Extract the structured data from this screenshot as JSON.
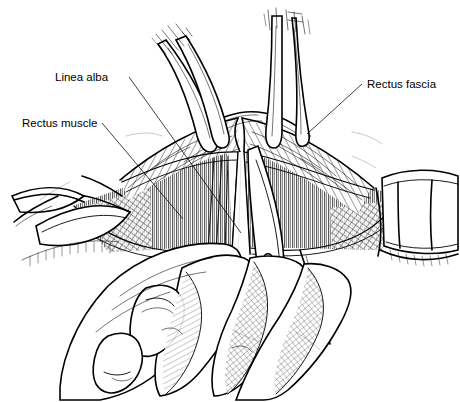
{
  "figure": {
    "kind": "surgical-anatomy-line-drawing",
    "background_color": "#ffffff",
    "ink_color": "#000000",
    "width": 460,
    "height": 402
  },
  "labels": [
    {
      "id": "linea-alba",
      "text": "Linea alba",
      "x": 55,
      "y": 81,
      "anchor": "start",
      "leader": "M129,77 L241,233"
    },
    {
      "id": "rectus-muscle",
      "text": "Rectus muscle",
      "x": 22,
      "y": 127,
      "anchor": "start",
      "leader": "M102,123 L183,219"
    },
    {
      "id": "rectus-fascia",
      "text": "Rectus fascia",
      "x": 367,
      "y": 88,
      "anchor": "start",
      "leader": "M362,84 L307,134"
    }
  ],
  "instruments": [
    {
      "id": "forceps-left",
      "name": "tissue-forceps",
      "count": 2,
      "position": "upper-left-of-midline"
    },
    {
      "id": "forceps-right",
      "name": "tissue-forceps",
      "count": 2,
      "position": "upper-right-of-midline"
    },
    {
      "id": "scissors",
      "name": "dissecting-scissors",
      "position": "center-lower",
      "rivet": true
    },
    {
      "id": "retractor-left",
      "name": "retractor-blade",
      "position": "left-edge"
    },
    {
      "id": "retractor-right",
      "name": "retractor-blade",
      "position": "right-edge"
    },
    {
      "id": "hand",
      "name": "surgeon-hand",
      "position": "bottom-center",
      "fingers": 4
    }
  ],
  "anatomy": [
    {
      "id": "fascia-flap-left",
      "name": "rectus-fascia-flap",
      "texture": "stipple-hatch"
    },
    {
      "id": "fascia-flap-right",
      "name": "rectus-fascia-flap",
      "texture": "stipple-hatch"
    },
    {
      "id": "muscle-belly",
      "name": "rectus-abdominis-muscle",
      "texture": "vertical-striations"
    },
    {
      "id": "midline",
      "name": "linea-alba-midline",
      "texture": "smooth"
    }
  ]
}
